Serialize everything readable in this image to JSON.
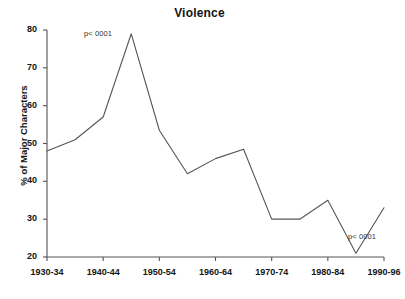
{
  "chart_data": {
    "type": "line",
    "title": "Violence",
    "xlabel": "",
    "ylabel": "% of Major Characters",
    "ylim": [
      20,
      80
    ],
    "y_ticks": [
      20,
      30,
      40,
      50,
      60,
      70,
      80
    ],
    "grid": false,
    "legend": null,
    "categories": [
      "1930-34",
      "1935-39",
      "1940-44",
      "1945-49",
      "1950-54",
      "1955-59",
      "1960-64",
      "1965-69",
      "1970-74",
      "1975-79",
      "1980-84",
      "1985-89",
      "1990-96"
    ],
    "x_tick_labels": [
      "1930-34",
      "1940-44",
      "1950-54",
      "1960-64",
      "1970-74",
      "1980-84",
      "1990-96"
    ],
    "values": [
      48,
      51,
      57,
      79,
      53.5,
      42,
      46,
      48.5,
      30,
      30,
      35,
      21,
      33
    ],
    "series": [
      {
        "name": "Violence",
        "values": [
          48,
          51,
          57,
          79,
          53.5,
          42,
          46,
          48.5,
          30,
          30,
          35,
          21,
          33
        ],
        "color": "#555555"
      }
    ],
    "annotations": [
      {
        "text": "p< 0001",
        "at_category": "1945-49",
        "position": "upper-left-of-peak"
      },
      {
        "text": "p< 0001",
        "at_category": "1990-96",
        "position": "lower-left-of-end"
      }
    ],
    "line_color": "#555555",
    "axis_color": "#555555"
  }
}
